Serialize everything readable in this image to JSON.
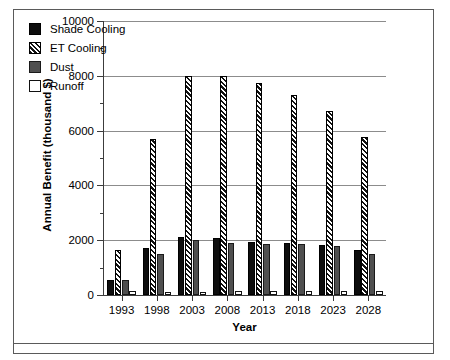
{
  "chart_data": {
    "type": "bar",
    "title": "",
    "xlabel": "Year",
    "ylabel": "Annual Benefit (thousand $)",
    "categories": [
      "1993",
      "1998",
      "2003",
      "2008",
      "2013",
      "2018",
      "2023",
      "2028"
    ],
    "ylim": [
      0,
      10000
    ],
    "ytick_labels": [
      "0",
      "2000",
      "4000",
      "6000",
      "8000",
      "10000"
    ],
    "ytick_values": [
      0,
      2000,
      4000,
      6000,
      8000,
      10000
    ],
    "yminor_values": [
      1000,
      3000,
      5000,
      7000,
      9000
    ],
    "grid": "horizontal-major",
    "legend_position": "upper-left-inside",
    "series": [
      {
        "name": "Shade Cooling",
        "style": "solid-black",
        "color": "#0d0d0d",
        "values": [
          550,
          1700,
          2130,
          2070,
          1950,
          1900,
          1830,
          1650
        ]
      },
      {
        "name": "ET Cooling",
        "style": "diagonal-hatch",
        "color": "#111111",
        "values": [
          1650,
          5700,
          8000,
          8000,
          7750,
          7300,
          6700,
          5750
        ]
      },
      {
        "name": "Dust",
        "style": "solid-gray",
        "color": "#4f4f4f",
        "values": [
          560,
          1500,
          2000,
          1900,
          1870,
          1850,
          1790,
          1500
        ]
      },
      {
        "name": "Runoff",
        "style": "open-white",
        "color": "#ffffff",
        "values": [
          140,
          120,
          120,
          130,
          130,
          130,
          130,
          130
        ]
      }
    ]
  },
  "legend": {
    "items": [
      {
        "label": "Shade Cooling",
        "swatch": "legend-swatch-solid-black"
      },
      {
        "label": "ET Cooling",
        "swatch": "legend-swatch-hatched"
      },
      {
        "label": "Dust",
        "swatch": "legend-swatch-solid-gray"
      },
      {
        "label": "Runoff",
        "swatch": "legend-swatch-open-white"
      }
    ]
  },
  "colors": {
    "shade_cooling": "#0d0d0d",
    "et_cooling": "#111111",
    "dust": "#4f4f4f",
    "runoff": "#ffffff",
    "axis": "#3c3c3c",
    "gridline": "#8c8c8c",
    "frame": "#5a5a5a",
    "background": "#ffffff"
  }
}
